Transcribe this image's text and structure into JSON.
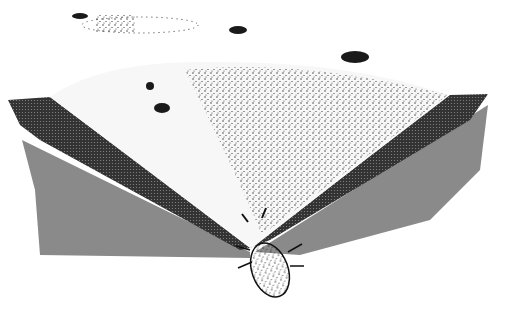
{
  "illustration": {
    "subject": "antlion pit with ants",
    "colors": {
      "background": "#ffffff",
      "shadow": "#8a8a8a",
      "ink": "#1a1a1a",
      "sand": "#f4f4f4"
    }
  }
}
